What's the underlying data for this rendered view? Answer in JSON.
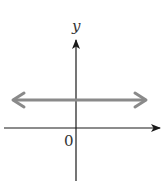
{
  "diagram": {
    "type": "coordinate-plane",
    "y_axis_label": "y",
    "origin_label": "0",
    "colors": {
      "axes": "#1a1a1a",
      "line": "#8a8a8a",
      "text": "#333333"
    }
  }
}
